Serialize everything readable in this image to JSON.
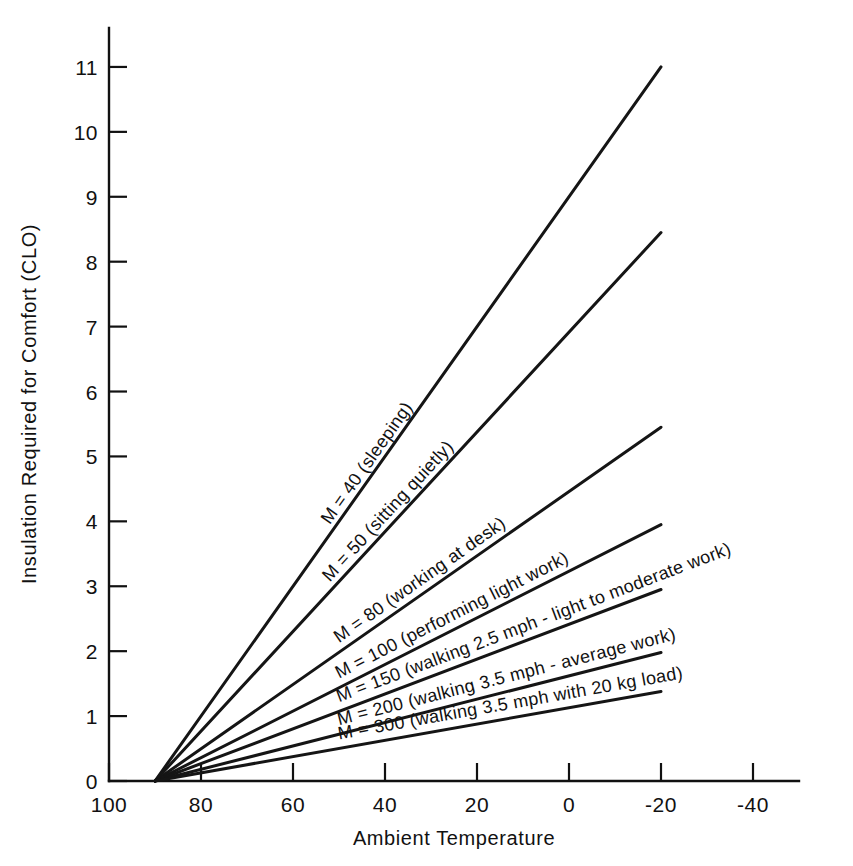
{
  "chart_data": {
    "type": "line",
    "title": "",
    "subtitle": "",
    "xlabel": "Ambient Temperature",
    "ylabel": "Insulation Required for Comfort (CLO)",
    "xlim": [
      100,
      -50
    ],
    "ylim": [
      0,
      11.6
    ],
    "x_ticks": [
      "100",
      "80",
      "60",
      "40",
      "20",
      "0",
      "-20",
      "-40"
    ],
    "x_tick_values": [
      100,
      80,
      60,
      40,
      20,
      0,
      -20,
      -40
    ],
    "y_ticks": [
      "0",
      "1",
      "2",
      "3",
      "4",
      "5",
      "6",
      "7",
      "8",
      "9",
      "10",
      "11"
    ],
    "y_tick_values": [
      0,
      1,
      2,
      3,
      4,
      5,
      6,
      7,
      8,
      9,
      10,
      11
    ],
    "grid": false,
    "legend_position": "inline-on-lines",
    "convergence_point": {
      "x": 90,
      "y": 0
    },
    "series": [
      {
        "name": "M = 40 (sleeping)",
        "label": "M = 40 (sleeping)",
        "metabolic_rate": 40,
        "activity": "sleeping",
        "x": [
          90,
          -20
        ],
        "y": [
          0,
          11.0
        ]
      },
      {
        "name": "M = 50 (sitting quietly)",
        "label": "M = 50 (sitting quietly)",
        "metabolic_rate": 50,
        "activity": "sitting quietly",
        "x": [
          90,
          -20
        ],
        "y": [
          0,
          8.45
        ]
      },
      {
        "name": "M = 80 (working at desk)",
        "label": "M = 80 (working at desk)",
        "metabolic_rate": 80,
        "activity": "working at desk",
        "x": [
          90,
          -20
        ],
        "y": [
          0,
          5.45
        ]
      },
      {
        "name": "M = 100 (performing light work)",
        "label": "M = 100 (performing light work)",
        "metabolic_rate": 100,
        "activity": "performing light work",
        "x": [
          90,
          -20
        ],
        "y": [
          0,
          3.95
        ]
      },
      {
        "name": "M = 150 (walking 2.5 mph - light to moderate work)",
        "label": "M = 150 (walking 2.5 mph - light to moderate work)",
        "metabolic_rate": 150,
        "activity": "walking 2.5 mph - light to moderate work",
        "x": [
          90,
          -20
        ],
        "y": [
          0,
          2.95
        ]
      },
      {
        "name": "M = 200 (walking 3.5 mph - average work)",
        "label": "M = 200 (walking 3.5 mph - average work)",
        "metabolic_rate": 200,
        "activity": "walking 3.5 mph - average work",
        "x": [
          90,
          -20
        ],
        "y": [
          0,
          1.98
        ]
      },
      {
        "name": "M = 300 (walking 3.5 mph with 20 kg load)",
        "label": "M = 300 (walking 3.5 mph with 20 kg load)",
        "metabolic_rate": 300,
        "activity": "walking 3.5 mph with 20 kg load",
        "x": [
          90,
          -20
        ],
        "y": [
          0,
          1.38
        ]
      }
    ],
    "colors": {
      "line": "#151515",
      "axis": "#111111",
      "text": "#111111",
      "background": "#ffffff"
    }
  }
}
